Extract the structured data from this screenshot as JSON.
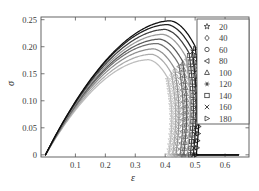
{
  "chart_data": {
    "type": "line",
    "title": "",
    "subtitle": "",
    "xlabel": "ε",
    "ylabel": "σ",
    "xlim": [
      -0.015,
      0.68
    ],
    "ylim": [
      -0.004,
      0.255
    ],
    "xticks": [
      0.1,
      0.2,
      0.3,
      0.4,
      0.5,
      0.6
    ],
    "xtick_labels": [
      "0.1",
      "0.2",
      "0.3",
      "0.4",
      "0.5",
      "0.6"
    ],
    "yticks": [
      0,
      0.05,
      0.1,
      0.15,
      0.2,
      0.25
    ],
    "ytick_labels": [
      "0",
      "0.05",
      "0.10",
      "0.15",
      "0.20",
      "0.25"
    ],
    "grid": false,
    "legend_position": "upper-right",
    "legend_title": "",
    "marker_shapes": [
      "star5",
      "diamond",
      "circle",
      "triangle-left",
      "triangle-up",
      "asterisk",
      "square",
      "x",
      "triangle-right"
    ],
    "series": [
      {
        "name": "20",
        "label": "20",
        "marker": "star5",
        "color": "#bdbdbd",
        "peak": {
          "x": 0.345,
          "y": 0.176
        },
        "drop_x": 0.408,
        "tail_end_x": 0.645,
        "x": [
          0.0,
          0.02,
          0.05,
          0.09,
          0.13,
          0.18,
          0.23,
          0.28,
          0.33,
          0.345,
          0.37,
          0.39,
          0.402,
          0.408,
          0.408,
          0.409,
          0.41,
          0.412,
          0.645
        ],
        "y": [
          0.0,
          0.031,
          0.066,
          0.102,
          0.129,
          0.152,
          0.166,
          0.174,
          0.176,
          0.176,
          0.173,
          0.167,
          0.16,
          0.15,
          0.11,
          0.065,
          0.028,
          0.0,
          0.0
        ]
      },
      {
        "name": "40",
        "label": "40",
        "marker": "diamond",
        "color": "#ababab",
        "peak": {
          "x": 0.355,
          "y": 0.186
        },
        "drop_x": 0.421,
        "tail_end_x": 0.645,
        "x": [
          0.0,
          0.02,
          0.05,
          0.09,
          0.13,
          0.18,
          0.23,
          0.28,
          0.33,
          0.355,
          0.38,
          0.4,
          0.414,
          0.421,
          0.421,
          0.422,
          0.423,
          0.425,
          0.645
        ],
        "y": [
          0.0,
          0.032,
          0.069,
          0.107,
          0.136,
          0.16,
          0.175,
          0.183,
          0.186,
          0.186,
          0.183,
          0.177,
          0.17,
          0.158,
          0.115,
          0.068,
          0.03,
          0.0,
          0.0
        ]
      },
      {
        "name": "60",
        "label": "60",
        "marker": "circle",
        "color": "#8f8f8f",
        "peak": {
          "x": 0.362,
          "y": 0.196
        },
        "drop_x": 0.432,
        "tail_end_x": 0.645,
        "x": [
          0.0,
          0.02,
          0.05,
          0.09,
          0.13,
          0.18,
          0.23,
          0.28,
          0.33,
          0.362,
          0.39,
          0.41,
          0.425,
          0.432,
          0.432,
          0.433,
          0.434,
          0.436,
          0.645
        ],
        "y": [
          0.0,
          0.033,
          0.072,
          0.112,
          0.143,
          0.169,
          0.185,
          0.193,
          0.196,
          0.196,
          0.193,
          0.187,
          0.179,
          0.166,
          0.12,
          0.072,
          0.032,
          0.0,
          0.0
        ]
      },
      {
        "name": "80",
        "label": "80",
        "marker": "triangle-left",
        "color": "#717171",
        "peak": {
          "x": 0.372,
          "y": 0.206
        },
        "drop_x": 0.446,
        "tail_end_x": 0.645,
        "x": [
          0.0,
          0.02,
          0.05,
          0.09,
          0.13,
          0.18,
          0.23,
          0.28,
          0.34,
          0.372,
          0.4,
          0.42,
          0.438,
          0.446,
          0.446,
          0.447,
          0.448,
          0.45,
          0.645
        ],
        "y": [
          0.0,
          0.034,
          0.074,
          0.116,
          0.149,
          0.177,
          0.194,
          0.203,
          0.206,
          0.206,
          0.203,
          0.197,
          0.188,
          0.174,
          0.126,
          0.075,
          0.033,
          0.0,
          0.0
        ]
      },
      {
        "name": "100",
        "label": "100",
        "marker": "triangle-up",
        "color": "#5a5a5a",
        "peak": {
          "x": 0.382,
          "y": 0.214
        },
        "drop_x": 0.458,
        "tail_end_x": 0.645,
        "x": [
          0.0,
          0.02,
          0.05,
          0.09,
          0.13,
          0.18,
          0.23,
          0.29,
          0.34,
          0.382,
          0.41,
          0.43,
          0.45,
          0.458,
          0.458,
          0.459,
          0.46,
          0.462,
          0.645
        ],
        "y": [
          0.0,
          0.035,
          0.076,
          0.119,
          0.154,
          0.183,
          0.201,
          0.21,
          0.214,
          0.214,
          0.211,
          0.205,
          0.195,
          0.181,
          0.131,
          0.078,
          0.034,
          0.0,
          0.0
        ]
      },
      {
        "name": "120",
        "label": "120",
        "marker": "asterisk",
        "color": "#9a9a9a",
        "peak": {
          "x": 0.392,
          "y": 0.223
        },
        "drop_x": 0.47,
        "tail_end_x": 0.645,
        "x": [
          0.0,
          0.02,
          0.05,
          0.09,
          0.13,
          0.18,
          0.24,
          0.29,
          0.35,
          0.392,
          0.42,
          0.44,
          0.462,
          0.47,
          0.47,
          0.471,
          0.472,
          0.474,
          0.645
        ],
        "y": [
          0.0,
          0.036,
          0.078,
          0.122,
          0.158,
          0.189,
          0.209,
          0.218,
          0.222,
          0.223,
          0.22,
          0.214,
          0.204,
          0.189,
          0.137,
          0.081,
          0.036,
          0.0,
          0.0
        ]
      },
      {
        "name": "140",
        "label": "140",
        "marker": "square",
        "color": "#3f3f3f",
        "peak": {
          "x": 0.4,
          "y": 0.232
        },
        "drop_x": 0.48,
        "tail_end_x": 0.645,
        "x": [
          0.0,
          0.02,
          0.05,
          0.09,
          0.13,
          0.18,
          0.24,
          0.3,
          0.36,
          0.4,
          0.43,
          0.45,
          0.472,
          0.48,
          0.48,
          0.481,
          0.482,
          0.484,
          0.645
        ],
        "y": [
          0.0,
          0.037,
          0.08,
          0.125,
          0.162,
          0.195,
          0.216,
          0.226,
          0.231,
          0.232,
          0.229,
          0.222,
          0.212,
          0.196,
          0.142,
          0.084,
          0.037,
          0.0,
          0.0
        ]
      },
      {
        "name": "160",
        "label": "160",
        "marker": "x",
        "color": "#222222",
        "peak": {
          "x": 0.408,
          "y": 0.241
        },
        "drop_x": 0.49,
        "tail_end_x": 0.645,
        "x": [
          0.0,
          0.02,
          0.05,
          0.09,
          0.13,
          0.19,
          0.25,
          0.31,
          0.37,
          0.408,
          0.44,
          0.46,
          0.482,
          0.49,
          0.49,
          0.491,
          0.492,
          0.494,
          0.645
        ],
        "y": [
          0.0,
          0.038,
          0.082,
          0.128,
          0.166,
          0.202,
          0.224,
          0.235,
          0.24,
          0.241,
          0.238,
          0.231,
          0.22,
          0.204,
          0.148,
          0.088,
          0.038,
          0.0,
          0.0
        ]
      },
      {
        "name": "180",
        "label": "180",
        "marker": "triangle-right",
        "color": "#0d0d0d",
        "peak": {
          "x": 0.418,
          "y": 0.248
        },
        "drop_x": 0.5,
        "tail_end_x": 0.645,
        "x": [
          0.0,
          0.02,
          0.05,
          0.09,
          0.13,
          0.19,
          0.25,
          0.31,
          0.38,
          0.418,
          0.45,
          0.47,
          0.492,
          0.5,
          0.5,
          0.501,
          0.502,
          0.504,
          0.645
        ],
        "y": [
          0.0,
          0.039,
          0.084,
          0.131,
          0.17,
          0.207,
          0.231,
          0.242,
          0.247,
          0.248,
          0.245,
          0.238,
          0.226,
          0.21,
          0.152,
          0.09,
          0.039,
          0.0,
          0.0
        ]
      }
    ]
  },
  "legend": {
    "entries": [
      {
        "label": "20"
      },
      {
        "label": "40"
      },
      {
        "label": "60"
      },
      {
        "label": "80"
      },
      {
        "label": "100"
      },
      {
        "label": "120"
      },
      {
        "label": "140"
      },
      {
        "label": "160"
      },
      {
        "label": "180"
      }
    ]
  },
  "axes": {
    "x_label": "ε",
    "y_label": "σ"
  }
}
